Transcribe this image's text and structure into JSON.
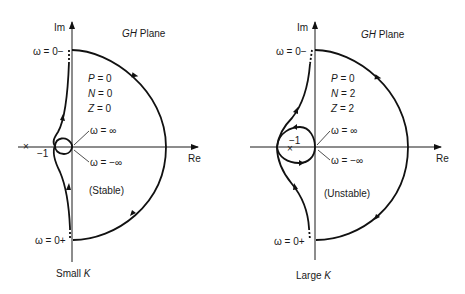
{
  "figure": {
    "panels": [
      {
        "id": "small-k",
        "im_label": "Im",
        "re_label": "Re",
        "plane_label_italic": "GH",
        "plane_label_rest": " Plane",
        "omega_zero_minus": "ω = 0−",
        "omega_zero_plus": "ω = 0+",
        "omega_inf": "ω = ∞",
        "omega_neg_inf": "ω = −∞",
        "critical_point_marker": "×",
        "critical_point_label": "−1",
        "stats": {
          "p": {
            "var": "P",
            "value": "= 0"
          },
          "n": {
            "var": "N",
            "value": "= 0"
          },
          "z": {
            "var": "Z",
            "value": "= 2"
          }
        },
        "stability": "(Stable)",
        "caption_prefix": "Small ",
        "caption_var": "K"
      },
      {
        "id": "large-k",
        "im_label": "Im",
        "re_label": "Re",
        "plane_label_italic": "GH",
        "plane_label_rest": " Plane",
        "omega_zero_minus": "ω = 0−",
        "omega_zero_plus": "ω = 0+",
        "omega_inf": "ω = ∞",
        "omega_neg_inf": "ω = −∞",
        "critical_point_marker": "×",
        "critical_point_label": "−1",
        "stats": {
          "p": {
            "var": "P",
            "value": "= 0"
          },
          "n": {
            "var": "N",
            "value": "= 2"
          },
          "z": {
            "var": "Z",
            "value": "= 2"
          }
        },
        "stability": "(Unstable)",
        "caption_prefix": "Large ",
        "caption_var": "K"
      }
    ]
  }
}
